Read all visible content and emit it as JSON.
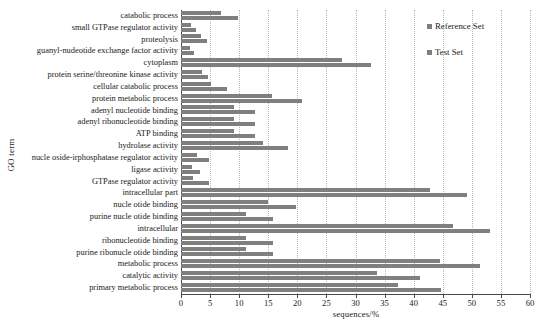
{
  "chart_data": {
    "type": "bar",
    "orientation": "horizontal",
    "title": "",
    "xlabel": "sequences/%",
    "ylabel": "GO term",
    "xlim": [
      0,
      60
    ],
    "xticks": [
      0,
      5,
      10,
      15,
      20,
      25,
      30,
      35,
      40,
      45,
      50,
      55,
      60
    ],
    "grid": true,
    "legend_position": "top-right",
    "bar_color": "#7f7f7f",
    "categories": [
      "catabolic process",
      "small GTPase regulator activity",
      "proteolysis",
      "guanyl-nudeotide exchange factor activity",
      "cytoplasm",
      "protein serine/threonine kinase activity",
      "cellular catabolic process",
      "protein metabolic process",
      "adenyl nucleotide binding",
      "adenyl ribonucleotide binding",
      "ATP binding",
      "hydrolase activity",
      "nucle oside-irphosphatase regulator activity",
      "ligase activity",
      "GTPase regulator activity",
      "intracellular part",
      "nucle otide binding",
      "purine nucle otide binding",
      "intracellular",
      "ribonucleotide binding",
      "purine ribonucle otide binding",
      "metabolic process",
      "catalytic activity",
      "primary metabolic process"
    ],
    "series": [
      {
        "name": "Reference Set",
        "values": [
          6.9,
          1.8,
          3.4,
          1.5,
          27.6,
          3.6,
          5.1,
          15.6,
          9.1,
          9.1,
          9.1,
          14.1,
          2.7,
          1.9,
          2.1,
          42.8,
          15.0,
          11.2,
          46.7,
          11.2,
          11.2,
          44.5,
          33.7,
          37.3
        ]
      },
      {
        "name": "Test Set",
        "values": [
          9.8,
          2.6,
          4.5,
          2.3,
          32.7,
          4.7,
          7.9,
          20.8,
          12.7,
          12.7,
          12.7,
          18.4,
          4.8,
          3.3,
          4.8,
          49.2,
          19.8,
          15.8,
          53.1,
          15.8,
          15.8,
          51.4,
          41.1,
          44.7
        ]
      }
    ]
  },
  "legend": {
    "items": [
      {
        "label": "Reference Set",
        "color": "#7f7f7f"
      },
      {
        "label": "Test Set",
        "color": "#7f7f7f"
      }
    ]
  },
  "axes": {
    "y_title": "GO term",
    "x_title": "sequences/%"
  }
}
